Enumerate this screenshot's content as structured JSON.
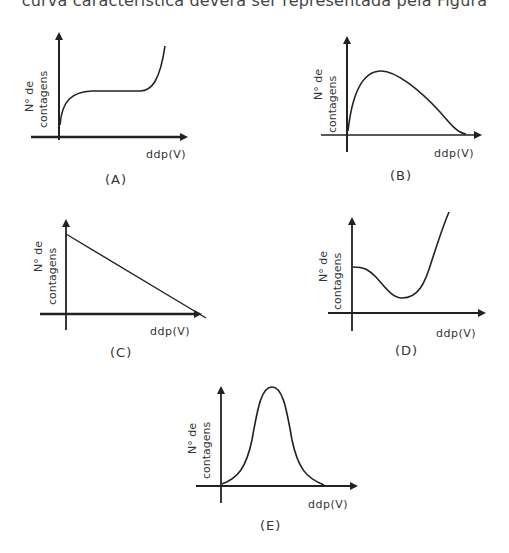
{
  "header": {
    "text": "curva característica deverá ser representada pela Figura"
  },
  "axis_labels": {
    "y_line1": "N° de",
    "y_line2": "contagens",
    "x": "ddp(V)"
  },
  "panels": [
    {
      "id": "A",
      "label": "(A)",
      "description": "rises steeply, flat plateau, then rises steeply again"
    },
    {
      "id": "B",
      "label": "(B)",
      "description": "rises to a peak then decays to zero"
    },
    {
      "id": "C",
      "label": "(C)",
      "description": "straight line decreasing linearly to zero"
    },
    {
      "id": "D",
      "label": "(D)",
      "description": "starts at nonzero value, dips to a minimum, then rises sharply"
    },
    {
      "id": "E",
      "label": "(E)",
      "description": "bell-shaped curve (peak)"
    }
  ],
  "colors": {
    "line": "#222222",
    "background": "#ffffff"
  }
}
